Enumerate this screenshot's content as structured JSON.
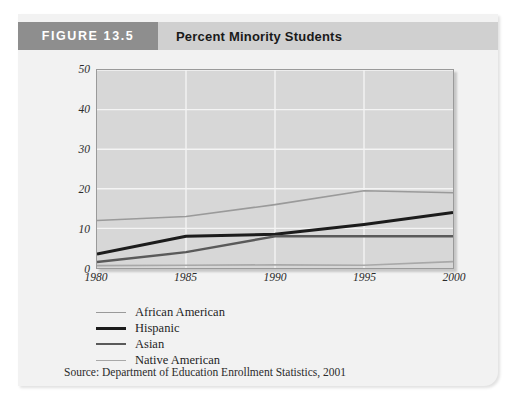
{
  "figure": {
    "tag": "FIGURE 13.5",
    "title": "Percent Minority Students",
    "source": "Source: Department of Education Enrollment Statistics, 2001"
  },
  "colors": {
    "card_background": "#f2f2f2",
    "header_band": "#d0d0d0",
    "figure_tag_background": "#8e8e8e",
    "plot_background": "#d7d7d7",
    "gridline": "#f4f4f4",
    "african_american": "#9a9a9a",
    "hispanic": "#1c1c1c",
    "asian": "#5a5a5a",
    "native_american": "#a8a8a8"
  },
  "legend": [
    {
      "label": "African American",
      "color": "#9a9a9a",
      "width": 1.6
    },
    {
      "label": "Hispanic",
      "color": "#1c1c1c",
      "width": 3.0
    },
    {
      "label": "Asian",
      "color": "#5a5a5a",
      "width": 2.4
    },
    {
      "label": "Native American",
      "color": "#a8a8a8",
      "width": 1.6
    }
  ],
  "chart_data": {
    "type": "line",
    "title": "Percent Minority Students",
    "xlabel": "",
    "ylabel": "",
    "x": [
      1980,
      1985,
      1990,
      1995,
      2000
    ],
    "xticklabels": [
      "1980",
      "1985",
      "1990",
      "1995",
      "2000"
    ],
    "yticks": [
      0,
      10,
      20,
      30,
      40,
      50
    ],
    "yticklabels": [
      "0",
      "10",
      "20",
      "30",
      "40",
      "50"
    ],
    "ylim": [
      0,
      50
    ],
    "xlim": [
      1980,
      2000
    ],
    "grid": true,
    "legend_position": "below-plot-left",
    "series": [
      {
        "name": "African American",
        "values": [
          12,
          13,
          16,
          19.5,
          19
        ]
      },
      {
        "name": "Hispanic",
        "values": [
          3.5,
          8,
          8.5,
          11,
          14
        ]
      },
      {
        "name": "Asian",
        "values": [
          1.5,
          4,
          8,
          8,
          8
        ]
      },
      {
        "name": "Native American",
        "values": [
          0.6,
          0.7,
          0.8,
          0.7,
          1.6
        ]
      }
    ]
  }
}
